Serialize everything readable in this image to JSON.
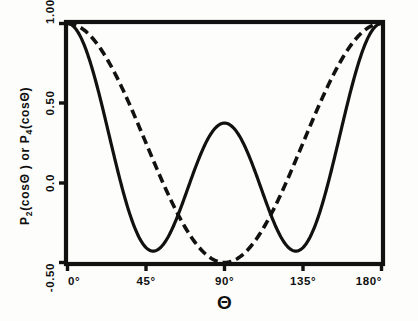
{
  "figure": {
    "background_color": "#fdfdfb",
    "ink_color": "#111111"
  },
  "axes": {
    "y_axis_title": "P₂(cosΘ) or P₄(cosΘ)",
    "x_axis_title": "Θ",
    "y_ticks": [
      "1.00",
      "0.50",
      "0.0",
      "-0.50"
    ],
    "x_ticks": [
      "0°",
      "45°",
      "90°",
      "135°",
      "180°"
    ]
  },
  "chart_data": {
    "type": "line",
    "title": "",
    "xlabel": "Θ",
    "ylabel": "P₂(cosΘ) or P₄(cosΘ)",
    "xlim": [
      0,
      180
    ],
    "ylim": [
      -0.5,
      1.0
    ],
    "xticks": [
      0,
      45,
      90,
      135,
      180
    ],
    "xticklabels": [
      "0°",
      "45°",
      "90°",
      "135°",
      "180°"
    ],
    "yticks": [
      -0.5,
      0.0,
      0.5,
      1.0
    ],
    "yticklabels": [
      "-0.50",
      "0.0",
      "0.50",
      "1.00"
    ],
    "grid": false,
    "legend": "none",
    "x": [
      0,
      5,
      10,
      15,
      20,
      25,
      30,
      35,
      40,
      45,
      50,
      55,
      60,
      65,
      70,
      75,
      80,
      85,
      90,
      95,
      100,
      105,
      110,
      115,
      120,
      125,
      130,
      135,
      140,
      145,
      150,
      155,
      160,
      165,
      170,
      175,
      180
    ],
    "series": [
      {
        "name": "P₂(cosΘ)",
        "style": "dashed",
        "formula": "(3cos²Θ - 1)/2",
        "values": [
          1.0,
          0.989,
          0.955,
          0.9,
          0.825,
          0.734,
          0.625,
          0.507,
          0.38,
          0.25,
          0.12,
          -0.007,
          -0.125,
          -0.232,
          -0.325,
          -0.4,
          -0.455,
          -0.489,
          -0.5,
          -0.489,
          -0.455,
          -0.4,
          -0.325,
          -0.232,
          -0.125,
          -0.007,
          0.12,
          0.25,
          0.38,
          0.507,
          0.625,
          0.734,
          0.825,
          0.9,
          0.955,
          0.989,
          1.0
        ]
      },
      {
        "name": "P₄(cosΘ)",
        "style": "solid",
        "formula": "(35cos⁴Θ - 30cos²Θ + 3)/8",
        "values": [
          1.0,
          0.971,
          0.886,
          0.754,
          0.588,
          0.406,
          0.227,
          0.068,
          -0.059,
          -0.156,
          -0.221,
          -0.258,
          -0.289,
          -0.284,
          -0.256,
          -0.201,
          -0.107,
          0.06,
          0.333,
          0.06,
          -0.107,
          -0.201,
          -0.256,
          -0.284,
          -0.289,
          -0.258,
          -0.221,
          -0.156,
          -0.059,
          0.068,
          0.227,
          0.406,
          0.588,
          0.754,
          0.886,
          0.971,
          1.0
        ]
      }
    ],
    "annotations": {
      "solid_local_max_at_90": 0.333,
      "solid_minima_theta_deg": [
        49,
        131
      ],
      "dashed_minimum_theta_deg": 90,
      "dashed_minimum_value": -0.5
    }
  }
}
